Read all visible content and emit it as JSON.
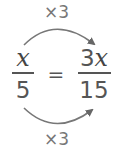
{
  "diagram": {
    "top_label": "×3",
    "bottom_label": "×3",
    "left_fraction": {
      "numerator": "x",
      "denominator": "5"
    },
    "equals": "=",
    "right_fraction": {
      "numerator_coef": "3",
      "numerator_var": "x",
      "denominator": "15"
    },
    "colors": {
      "arrow": "#777777",
      "text": "#444444"
    }
  }
}
